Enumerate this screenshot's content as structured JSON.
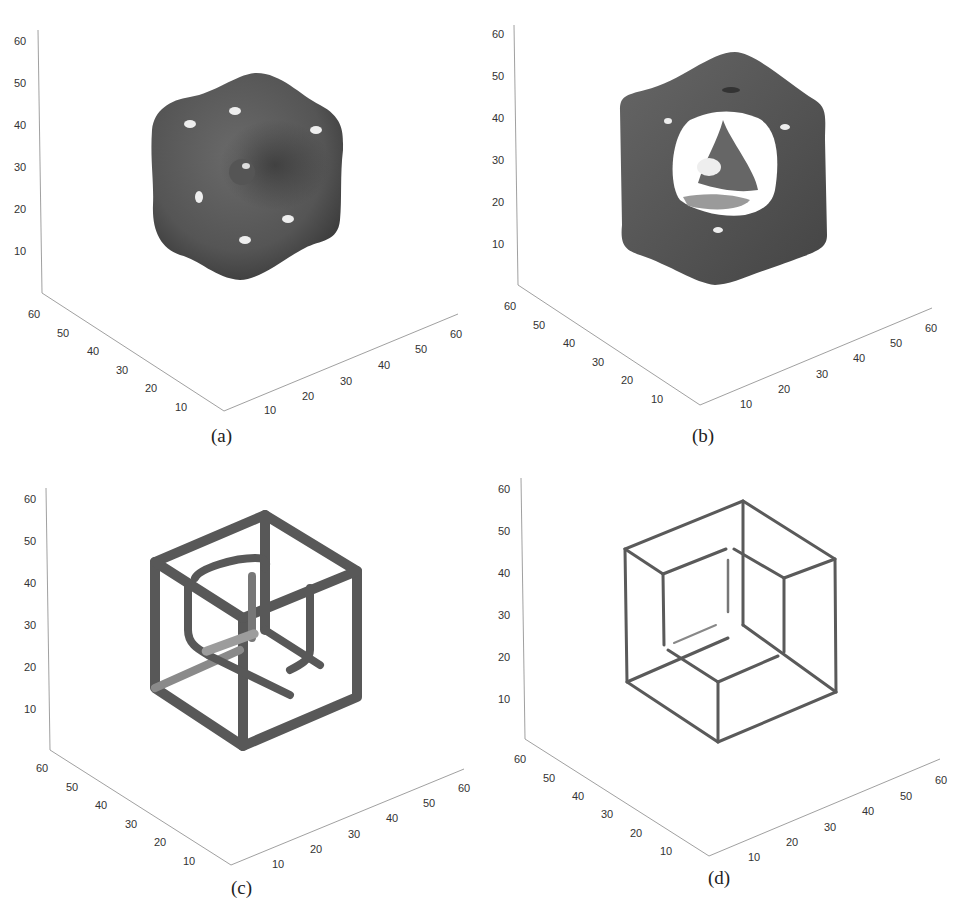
{
  "figure": {
    "panels": [
      {
        "id": "a",
        "caption": "(a)",
        "shape": "rounded-cube-blob-with-central-sphere",
        "z_ticks": [
          "60",
          "50",
          "40",
          "30",
          "20",
          "10"
        ],
        "y_ticks": [
          "60",
          "50",
          "40",
          "30",
          "20",
          "10"
        ],
        "x_ticks": [
          "10",
          "20",
          "30",
          "40",
          "50",
          "60"
        ]
      },
      {
        "id": "b",
        "caption": "(b)",
        "shape": "hollow-cube-shell-with-inner-tetrahedron",
        "z_ticks": [
          "60",
          "50",
          "40",
          "30",
          "20",
          "10"
        ],
        "y_ticks": [
          "60",
          "50",
          "40",
          "30",
          "20",
          "10"
        ],
        "x_ticks": [
          "10",
          "20",
          "30",
          "40",
          "50",
          "60"
        ]
      },
      {
        "id": "c",
        "caption": "(c)",
        "shape": "thick-tube-cube-frame",
        "z_ticks": [
          "60",
          "50",
          "40",
          "30",
          "20",
          "10"
        ],
        "y_ticks": [
          "60",
          "50",
          "40",
          "30",
          "20",
          "10"
        ],
        "x_ticks": [
          "10",
          "20",
          "30",
          "40",
          "50",
          "60"
        ]
      },
      {
        "id": "d",
        "caption": "(d)",
        "shape": "thin-wire-cube-frame",
        "z_ticks": [
          "60",
          "50",
          "40",
          "30",
          "20",
          "10"
        ],
        "y_ticks": [
          "60",
          "50",
          "40",
          "30",
          "20",
          "10"
        ],
        "x_ticks": [
          "10",
          "20",
          "30",
          "40",
          "50",
          "60"
        ]
      }
    ],
    "colors": {
      "surface": "#5c5c5c",
      "surface_dark": "#3e3e3e",
      "highlight": "#f2f2f2",
      "axis": "#777777",
      "background": "#ffffff"
    }
  }
}
